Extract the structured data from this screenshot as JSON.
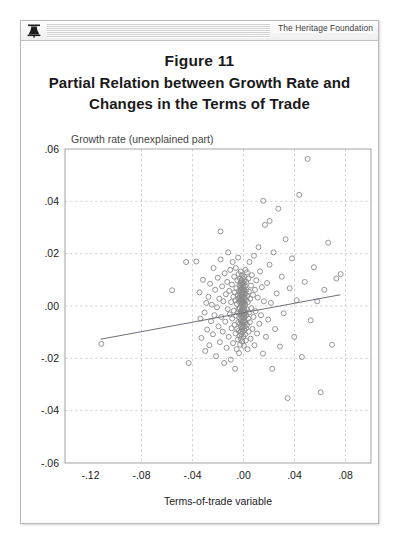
{
  "header": {
    "logo_icon": "heritage-bell-icon",
    "brand": "The Heritage Foundation"
  },
  "figure": {
    "number": "Figure 11",
    "title_line1": "Partial Relation between Growth Rate and",
    "title_line2": "Changes in the Terms of Trade"
  },
  "chart_data": {
    "type": "scatter",
    "title": "Partial Relation between Growth Rate and Changes in the Terms of Trade",
    "subtitle": "Figure 11",
    "xlabel": "Terms-of-trade variable",
    "ylabel": "Growth rate (unexplained part)",
    "ylabel_position": "top-inside",
    "grid": true,
    "grid_style": "dashed",
    "legend": null,
    "xlim": [
      -0.14,
      0.1
    ],
    "ylim": [
      -0.06,
      0.06
    ],
    "xticks": [
      -0.12,
      -0.08,
      -0.04,
      0.0,
      0.04,
      0.08
    ],
    "xticklabels": [
      "-.12",
      "-.08",
      "-.04",
      ".00",
      ".04",
      ".08"
    ],
    "yticks": [
      -0.06,
      -0.04,
      -0.02,
      0.0,
      0.02,
      0.04,
      0.06
    ],
    "yticklabels": [
      "-.06",
      "-.04",
      "-.02",
      ".00",
      ".02",
      ".04",
      ".06"
    ],
    "marker": "open-circle",
    "marker_color": "#8a8a8a",
    "n_points": 236,
    "fit_line": {
      "type": "linear",
      "x0": -0.112,
      "y0": -0.0127,
      "x1": 0.076,
      "y1": 0.0043,
      "slope": 0.0904,
      "intercept": -0.0026,
      "color": "#6e6e7a"
    },
    "points": [
      [
        -0.1115,
        -0.0145
      ],
      [
        -0.056,
        0.006
      ],
      [
        -0.037,
        0.017
      ],
      [
        -0.0345,
        0.0052
      ],
      [
        -0.0338,
        -0.0048
      ],
      [
        -0.033,
        -0.0122
      ],
      [
        -0.0318,
        0.01
      ],
      [
        -0.0305,
        -0.0025
      ],
      [
        -0.03,
        -0.0172
      ],
      [
        -0.0292,
        0.0012
      ],
      [
        -0.0285,
        -0.009
      ],
      [
        -0.0275,
        0.0035
      ],
      [
        -0.0268,
        -0.015
      ],
      [
        -0.0262,
        0.0085
      ],
      [
        -0.0255,
        -0.0058
      ],
      [
        -0.0248,
        0.0005
      ],
      [
        -0.024,
        -0.0108
      ],
      [
        -0.0235,
        0.0145
      ],
      [
        -0.0228,
        -0.0035
      ],
      [
        -0.0222,
        0.0062
      ],
      [
        -0.0215,
        -0.0192
      ],
      [
        -0.0208,
        -0.0005
      ],
      [
        -0.0202,
        0.0108
      ],
      [
        -0.0196,
        -0.0078
      ],
      [
        -0.019,
        0.0028
      ],
      [
        -0.0185,
        -0.0138
      ],
      [
        -0.018,
        0.0178
      ],
      [
        -0.0174,
        -0.0042
      ],
      [
        -0.0168,
        0.0075
      ],
      [
        -0.0163,
        -0.0098
      ],
      [
        -0.0158,
        0.0018
      ],
      [
        -0.0152,
        -0.0218
      ],
      [
        -0.0148,
        0.0125
      ],
      [
        -0.0143,
        -0.006
      ],
      [
        -0.0138,
        0.0045
      ],
      [
        -0.0133,
        -0.016
      ],
      [
        -0.0128,
        0.0092
      ],
      [
        -0.0124,
        -0.0012
      ],
      [
        -0.012,
        0.0205
      ],
      [
        -0.0116,
        -0.0118
      ],
      [
        -0.0112,
        0.0058
      ],
      [
        -0.0108,
        -0.0032
      ],
      [
        -0.0104,
        0.0138
      ],
      [
        -0.01,
        -0.0205
      ],
      [
        -0.0097,
        0.0015
      ],
      [
        -0.0094,
        -0.0085
      ],
      [
        -0.0091,
        0.0082
      ],
      [
        -0.0088,
        -0.0048
      ],
      [
        -0.0085,
        0.0168
      ],
      [
        -0.0082,
        -0.0142
      ],
      [
        -0.0079,
        0.0035
      ],
      [
        -0.0076,
        -0.0018
      ],
      [
        -0.0073,
        0.0112
      ],
      [
        -0.007,
        -0.0072
      ],
      [
        -0.0068,
        0.0052
      ],
      [
        -0.0066,
        -0.024
      ],
      [
        -0.0064,
        0.0022
      ],
      [
        -0.0062,
        -0.0105
      ],
      [
        -0.006,
        0.0145
      ],
      [
        -0.0058,
        -0.0038
      ],
      [
        -0.0056,
        0.0068
      ],
      [
        -0.0054,
        -0.0165
      ],
      [
        -0.0052,
        0.0008
      ],
      [
        -0.005,
        -0.0088
      ],
      [
        -0.0048,
        0.0098
      ],
      [
        -0.0046,
        -0.0025
      ],
      [
        -0.0045,
        0.0042
      ],
      [
        -0.0044,
        -0.0128
      ],
      [
        -0.0042,
        0.0185
      ],
      [
        -0.0041,
        -0.0062
      ],
      [
        -0.004,
        0.0028
      ],
      [
        -0.0039,
        -0.0012
      ],
      [
        -0.0038,
        0.0122
      ],
      [
        -0.0037,
        -0.0095
      ],
      [
        -0.0036,
        0.0058
      ],
      [
        -0.0035,
        -0.018
      ],
      [
        -0.0034,
        0.0015
      ],
      [
        -0.0033,
        -0.0045
      ],
      [
        -0.0032,
        0.0078
      ],
      [
        -0.0031,
        -0.0115
      ],
      [
        -0.003,
        0.0035
      ],
      [
        -0.0029,
        -0.0008
      ],
      [
        -0.0028,
        0.0105
      ],
      [
        -0.0027,
        -0.0068
      ],
      [
        -0.0027,
        0.0048
      ],
      [
        -0.0026,
        -0.0148
      ],
      [
        -0.0025,
        0.0018
      ],
      [
        -0.0025,
        -0.003
      ],
      [
        -0.0024,
        0.0088
      ],
      [
        -0.0023,
        -0.0098
      ],
      [
        -0.0023,
        0.0062
      ],
      [
        -0.0022,
        -0.0022
      ],
      [
        -0.0022,
        0.0132
      ],
      [
        -0.0021,
        -0.0055
      ],
      [
        -0.0021,
        0.0025
      ],
      [
        -0.002,
        -0.0125
      ],
      [
        -0.002,
        0.0072
      ],
      [
        -0.0019,
        -0.0002
      ],
      [
        -0.0019,
        0.0042
      ],
      [
        -0.0018,
        -0.0078
      ],
      [
        -0.0018,
        0.0098
      ],
      [
        -0.0017,
        -0.0038
      ],
      [
        -0.0017,
        0.0012
      ],
      [
        -0.0016,
        -0.0108
      ],
      [
        -0.0016,
        0.0055
      ],
      [
        -0.0015,
        -0.0018
      ],
      [
        -0.0015,
        0.0082
      ],
      [
        -0.0014,
        -0.0062
      ],
      [
        -0.0014,
        0.0032
      ],
      [
        -0.0013,
        -0.0088
      ],
      [
        -0.0013,
        0.0118
      ],
      [
        -0.0012,
        -0.0028
      ],
      [
        -0.0012,
        0.0008
      ],
      [
        -0.0011,
        -0.0135
      ],
      [
        -0.0011,
        0.0068
      ],
      [
        -0.001,
        -0.0048
      ],
      [
        -0.001,
        0.0022
      ],
      [
        -0.0009,
        -0.0072
      ],
      [
        -0.0009,
        0.0092
      ],
      [
        -0.0008,
        -0.0012
      ],
      [
        -0.0008,
        0.0045
      ],
      [
        -0.0007,
        -0.0098
      ],
      [
        -0.0007,
        0.0015
      ],
      [
        -0.0006,
        -0.0032
      ],
      [
        -0.0006,
        0.0062
      ],
      [
        -0.0005,
        -0.0058
      ],
      [
        -0.0005,
        0.0105
      ],
      [
        -0.0004,
        -0.0005
      ],
      [
        -0.0004,
        0.0035
      ],
      [
        -0.0003,
        -0.0082
      ],
      [
        -0.0003,
        0.0078
      ],
      [
        -0.0002,
        -0.0042
      ],
      [
        -0.0002,
        0.0018
      ],
      [
        -0.0001,
        -0.0118
      ],
      [
        -0.0001,
        0.0052
      ],
      [
        0.0,
        -0.0022
      ],
      [
        0.0,
        0.0002
      ],
      [
        0.0001,
        -0.0065
      ],
      [
        0.0001,
        0.0088
      ],
      [
        0.0002,
        -0.0038
      ],
      [
        0.0002,
        0.0028
      ],
      [
        0.0003,
        -0.0152
      ],
      [
        0.0003,
        0.0068
      ],
      [
        0.0004,
        -0.0008
      ],
      [
        0.0004,
        0.0042
      ],
      [
        0.0005,
        -0.0092
      ],
      [
        0.0005,
        0.0112
      ],
      [
        0.0006,
        -0.0028
      ],
      [
        0.0006,
        0.0012
      ],
      [
        0.0007,
        -0.0055
      ],
      [
        0.0008,
        0.0058
      ],
      [
        0.0008,
        -0.0015
      ],
      [
        0.0009,
        0.0098
      ],
      [
        0.001,
        -0.0078
      ],
      [
        0.001,
        0.0032
      ],
      [
        0.0011,
        -0.0042
      ],
      [
        0.0012,
        0.0075
      ],
      [
        0.0013,
        -0.0108
      ],
      [
        0.0013,
        0.0005
      ],
      [
        0.0014,
        -0.0025
      ],
      [
        0.0015,
        0.0138
      ],
      [
        0.0016,
        -0.0062
      ],
      [
        0.0017,
        0.0048
      ],
      [
        0.0018,
        -0.0132
      ],
      [
        0.0019,
        0.0022
      ],
      [
        0.002,
        -0.0085
      ],
      [
        0.0021,
        0.0092
      ],
      [
        0.0022,
        -0.0035
      ],
      [
        0.0024,
        0.0062
      ],
      [
        0.0025,
        -0.0012
      ],
      [
        0.0027,
        0.0128
      ],
      [
        0.0028,
        -0.0072
      ],
      [
        0.003,
        0.0038
      ],
      [
        0.0032,
        -0.0165
      ],
      [
        0.0034,
        0.0015
      ],
      [
        0.0036,
        -0.0048
      ],
      [
        0.0038,
        0.0105
      ],
      [
        0.004,
        -0.0098
      ],
      [
        0.0042,
        0.0055
      ],
      [
        0.0044,
        -0.0025
      ],
      [
        0.0047,
        0.0168
      ],
      [
        0.005,
        -0.0062
      ],
      [
        0.0053,
        0.0028
      ],
      [
        0.0056,
        -0.0125
      ],
      [
        0.0059,
        0.0078
      ],
      [
        0.0062,
        -0.0008
      ],
      [
        0.0066,
        0.0118
      ],
      [
        0.007,
        -0.0088
      ],
      [
        0.0074,
        0.0042
      ],
      [
        0.0078,
        -0.0042
      ],
      [
        0.0082,
        0.0192
      ],
      [
        0.0086,
        -0.015
      ],
      [
        0.009,
        0.0062
      ],
      [
        0.0095,
        -0.002
      ],
      [
        0.01,
        0.0098
      ],
      [
        0.0106,
        -0.0105
      ],
      [
        0.0112,
        0.0032
      ],
      [
        0.0118,
        0.0225
      ],
      [
        0.0124,
        -0.0068
      ],
      [
        0.013,
        0.0132
      ],
      [
        0.0137,
        -0.0035
      ],
      [
        0.0144,
        0.0072
      ],
      [
        0.0152,
        -0.0182
      ],
      [
        0.016,
        0.0018
      ],
      [
        0.0168,
        0.031
      ],
      [
        0.0176,
        -0.0118
      ],
      [
        0.0185,
        0.0088
      ],
      [
        0.0194,
        -0.0052
      ],
      [
        0.0204,
        0.0158
      ],
      [
        0.0214,
        0.0012
      ],
      [
        0.0225,
        -0.024
      ],
      [
        0.0236,
        0.0205
      ],
      [
        0.0248,
        -0.0088
      ],
      [
        0.026,
        0.0048
      ],
      [
        0.0273,
        0.0372
      ],
      [
        0.0286,
        -0.0155
      ],
      [
        0.03,
        0.0112
      ],
      [
        0.0315,
        -0.0028
      ],
      [
        0.033,
        0.0255
      ],
      [
        0.0346,
        -0.0352
      ],
      [
        0.0362,
        0.0068
      ],
      [
        0.038,
        0.0182
      ],
      [
        0.0398,
        -0.0118
      ],
      [
        0.0417,
        0.0022
      ],
      [
        0.0437,
        0.0425
      ],
      [
        0.0458,
        -0.0195
      ],
      [
        0.048,
        0.0092
      ],
      [
        0.0503,
        0.0562
      ],
      [
        0.0527,
        -0.0055
      ],
      [
        0.0552,
        0.0148
      ],
      [
        0.0578,
        0.0018
      ],
      [
        0.0605,
        -0.033
      ],
      [
        0.0634,
        0.0062
      ],
      [
        0.0664,
        0.0242
      ],
      [
        0.0695,
        -0.0148
      ],
      [
        0.0728,
        0.0105
      ],
      [
        0.0762,
        0.0122
      ],
      [
        -0.045,
        0.0168
      ],
      [
        -0.043,
        -0.0218
      ],
      [
        -0.018,
        0.0285
      ],
      [
        0.0155,
        0.0402
      ],
      [
        0.0205,
        0.0325
      ]
    ]
  }
}
